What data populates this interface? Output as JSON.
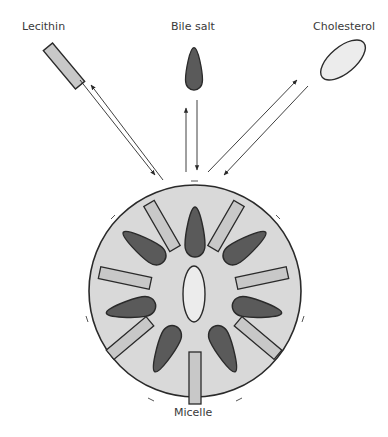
{
  "diagram": {
    "type": "micelle-formation",
    "labels": {
      "lecithin": "Lecithin",
      "bile_salt": "Bile salt",
      "cholesterol": "Cholesterol",
      "micelle": "Micelle"
    },
    "components": [
      {
        "name": "Lecithin",
        "shape": "rectangle",
        "fill": "#c8c8c8"
      },
      {
        "name": "Bile salt",
        "shape": "teardrop",
        "fill": "#5a5a5a"
      },
      {
        "name": "Cholesterol",
        "shape": "ellipse",
        "fill": "#ececec"
      }
    ],
    "arrows": [
      {
        "between": [
          "Lecithin",
          "Micelle"
        ],
        "direction": "bidirectional"
      },
      {
        "between": [
          "Bile salt",
          "Micelle"
        ],
        "direction": "bidirectional"
      },
      {
        "between": [
          "Cholesterol",
          "Micelle"
        ],
        "direction": "bidirectional"
      }
    ],
    "micelle": {
      "fill": "#d9d9d9",
      "core": "Cholesterol",
      "bile_salt_count": 8,
      "lecithin_count": 8
    },
    "colors": {
      "outline": "#2a2a2a",
      "micelle_fill": "#d9d9d9",
      "bile_salt_fill": "#5a5a5a",
      "lecithin_fill": "#c8c8c8",
      "cholesterol_fill": "#ececec"
    }
  }
}
